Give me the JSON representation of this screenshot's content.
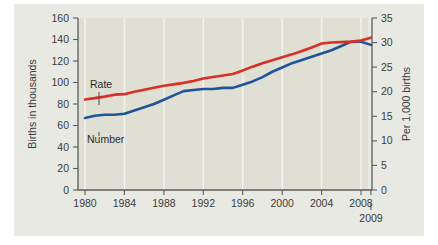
{
  "chart_data": {
    "type": "line",
    "title": "",
    "subtitle": "",
    "xlabel": "",
    "ylabel": "Births in thousands",
    "y2label": "Per 1,000 births",
    "grid": "vertical",
    "legend_position": "inline-annotation",
    "x": [
      1980,
      1981,
      1982,
      1983,
      1984,
      1985,
      1986,
      1987,
      1988,
      1989,
      1990,
      1991,
      1992,
      1993,
      1994,
      1995,
      1996,
      1997,
      1998,
      1999,
      2000,
      2001,
      2002,
      2003,
      2004,
      2005,
      2006,
      2007,
      2008,
      2009
    ],
    "x_tick_labels": [
      "1980",
      "1984",
      "1988",
      "1992",
      "1996",
      "2000",
      "2004",
      "2008"
    ],
    "x_ticks": [
      1980,
      1984,
      1988,
      1992,
      1996,
      2000,
      2004,
      2008
    ],
    "x_extra_label": "2009",
    "xlim": [
      1980,
      2009
    ],
    "ylim": [
      0,
      160
    ],
    "y_ticks": [
      0,
      20,
      40,
      60,
      80,
      100,
      120,
      140,
      160
    ],
    "y_tick_labels": [
      "0",
      "20",
      "40",
      "60",
      "80",
      "100",
      "120",
      "140",
      "160"
    ],
    "y2lim": [
      0,
      35
    ],
    "y2_ticks": [
      0,
      5,
      10,
      15,
      20,
      25,
      30,
      35
    ],
    "y2_tick_labels": [
      "0",
      "5",
      "10",
      "15",
      "20",
      "25",
      "30",
      "35"
    ],
    "series": [
      {
        "name": "Rate",
        "axis": "right",
        "color": "#dc2f24",
        "units": "Per 1,000 births",
        "values": [
          18.4,
          18.7,
          19.0,
          19.4,
          19.5,
          20.0,
          20.4,
          20.8,
          21.2,
          21.5,
          21.8,
          22.2,
          22.7,
          23.0,
          23.3,
          23.6,
          24.3,
          25.1,
          25.8,
          26.4,
          27.0,
          27.6,
          28.3,
          29.0,
          29.8,
          30.0,
          30.1,
          30.2,
          30.4,
          31.0
        ]
      },
      {
        "name": "Number",
        "axis": "left",
        "color": "#21539a",
        "units": "Births in thousands",
        "values": [
          67,
          69,
          70,
          70,
          71,
          74,
          77,
          80,
          84,
          88,
          92,
          93,
          94,
          94,
          95,
          95,
          98,
          101,
          105,
          110,
          114,
          118,
          121,
          124,
          127,
          130,
          134,
          138,
          138,
          135
        ]
      }
    ],
    "annotations": [
      {
        "label": "Rate",
        "series": "Rate"
      },
      {
        "label": "Number",
        "series": "Number"
      }
    ]
  },
  "colors": {
    "rate": "#dc2f24",
    "number": "#21539a",
    "card_background": "#e9e9e3",
    "plot_background": "#dfdfd3",
    "gridline": "#f3f3ee",
    "axis": "#5c5c5c",
    "text": "#3b3b3b"
  }
}
